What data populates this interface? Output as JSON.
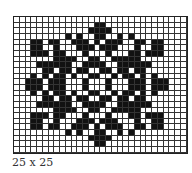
{
  "caption": "25 x 25",
  "pattern": {
    "cols": 30,
    "rows": 24,
    "rows_bitmap": [
      "000000000000000000000000000000",
      "000000000000001100000000000000",
      "000000000000011110000000000000",
      "000000000101001100101000000000",
      "000110110011101011100110110000",
      "000110010001110111000100110000",
      "000111011000100010001101110000",
      "000000011110011001111100000000",
      "000011111100111100111111000000",
      "000001101101100110110110000000",
      "000101011010011001011010100000",
      "001110111000100010001110111000",
      "001110111000100010001110111000",
      "000101011010011001011010100000",
      "000001101101100110110110000000",
      "000011111100111100111111000000",
      "000000011110011001111100000000",
      "000111011000100010001101110000",
      "000110010001110111000100110000",
      "000110110011101011100110110000",
      "000000000101001100101000000000",
      "000000000000011110000000000000",
      "000000000000001100000000000000",
      "000000000000000000000000000000"
    ],
    "fill_color": "#111111",
    "grid_color": "#333333",
    "background": "#ffffff"
  }
}
